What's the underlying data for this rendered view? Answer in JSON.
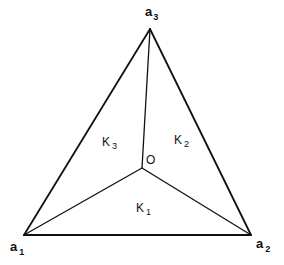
{
  "diagram": {
    "vertices": {
      "a1": {
        "label": "a",
        "sub": "1",
        "x": 24,
        "y": 235
      },
      "a2": {
        "label": "a",
        "sub": "2",
        "x": 251,
        "y": 235
      },
      "a3": {
        "label": "a",
        "sub": "3",
        "x": 150,
        "y": 29
      }
    },
    "center": {
      "label": "O",
      "x": 142,
      "y": 168
    },
    "regions": [
      {
        "id": "K1",
        "label": "K",
        "sub": "1",
        "x": 136,
        "y": 213
      },
      {
        "id": "K2",
        "label": "K",
        "sub": "2",
        "x": 174,
        "y": 145
      },
      {
        "id": "K3",
        "label": "K",
        "sub": "3",
        "x": 102,
        "y": 145
      }
    ],
    "edges": [
      {
        "from": "a1",
        "to": "a2",
        "type": "outer"
      },
      {
        "from": "a2",
        "to": "a3",
        "type": "outer"
      },
      {
        "from": "a3",
        "to": "a1",
        "type": "outer"
      },
      {
        "from": "O",
        "to": "a1",
        "type": "inner"
      },
      {
        "from": "O",
        "to": "a2",
        "type": "inner"
      },
      {
        "from": "O",
        "to": "a3",
        "type": "inner"
      }
    ],
    "stroke_color": "#111111",
    "background_color": "#ffffff"
  }
}
